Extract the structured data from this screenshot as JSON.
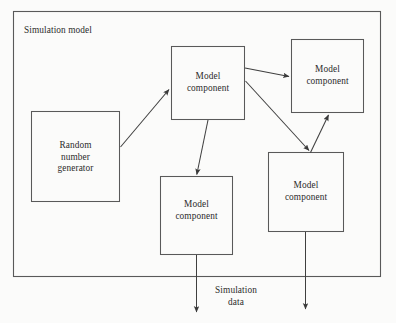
{
  "diagram": {
    "type": "block-flow-diagram",
    "outer_container": {
      "label": "Simulation model",
      "x": 13,
      "y": 11,
      "width": 368,
      "height": 266
    },
    "flow_label": {
      "text": "Simulation\ndata",
      "line1": "Simulation",
      "line2": "data"
    },
    "colors": {
      "background": "#fbfbfa",
      "stroke": "#4a4a4a",
      "text": "#2b2b2b"
    },
    "nodes": [
      {
        "id": "random-number-generator",
        "label": "Random\nnumber\ngenerator",
        "x": 31,
        "y": 111,
        "width": 89,
        "height": 91
      },
      {
        "id": "model-component-top-center",
        "label": "Model\ncomponent",
        "x": 171,
        "y": 46,
        "width": 74,
        "height": 74
      },
      {
        "id": "model-component-top-right",
        "label": "Model\ncomponent",
        "x": 291,
        "y": 39,
        "width": 73,
        "height": 74
      },
      {
        "id": "model-component-bottom-center",
        "label": "Model\ncomponent",
        "x": 160,
        "y": 176,
        "width": 73,
        "height": 79
      },
      {
        "id": "model-component-bottom-right",
        "label": "Model\ncomponent",
        "x": 268,
        "y": 152,
        "width": 76,
        "height": 80
      }
    ],
    "edges": [
      {
        "id": "rng-to-top-center",
        "from": "random-number-generator",
        "to": "model-component-top-center"
      },
      {
        "id": "top-center-to-top-right",
        "from": "model-component-top-center",
        "to": "model-component-top-right"
      },
      {
        "id": "top-center-to-bottom-right",
        "from": "model-component-top-center",
        "to": "model-component-bottom-right"
      },
      {
        "id": "top-center-to-bottom-center",
        "from": "model-component-top-center",
        "to": "model-component-bottom-center"
      },
      {
        "id": "bottom-right-to-top-right",
        "from": "model-component-bottom-right",
        "to": "model-component-top-right"
      },
      {
        "id": "bottom-center-to-output",
        "from": "model-component-bottom-center",
        "to": "simulation-data"
      },
      {
        "id": "bottom-right-to-output",
        "from": "model-component-bottom-right",
        "to": "simulation-data"
      }
    ]
  }
}
